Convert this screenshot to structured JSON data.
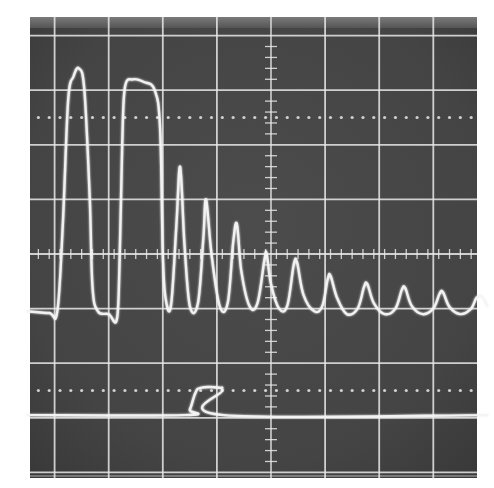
{
  "chart_data": {
    "type": "line",
    "title": "",
    "subtitle": "",
    "xlabel": "",
    "ylabel": "",
    "grid": true,
    "legend": "none",
    "graticule": {
      "x_divisions": 8.5,
      "y_divisions": 8,
      "xlim": [
        -4.5,
        4.0
      ],
      "ylim": [
        -4.0,
        4.0
      ],
      "center_axis_minor_ticks_per_division": 5,
      "dotted_reference_lines_y": [
        2.5,
        -2.5
      ]
    },
    "colors": {
      "screen": "#4a4a4a",
      "screen_dark": "#3a3a3a",
      "grid": "#e8e8e8",
      "trace": "#f4f4f4",
      "paper": "#ffffff"
    },
    "series": [
      {
        "name": "upper-trace",
        "description": "Baseline near -1.05 div with two broad pulses at the left followed by a decaying train of sharp peaks.",
        "baseline": -1.05,
        "points": [
          [
            -4.5,
            -1.05
          ],
          [
            -4.1,
            -1.08
          ],
          [
            -3.95,
            -1.05
          ],
          [
            -3.85,
            0.5
          ],
          [
            -3.75,
            2.8
          ],
          [
            -3.65,
            3.25
          ],
          [
            -3.55,
            3.4
          ],
          [
            -3.45,
            3.0
          ],
          [
            -3.35,
            1.0
          ],
          [
            -3.3,
            -0.6
          ],
          [
            -3.2,
            -1.05
          ],
          [
            -3.0,
            -1.1
          ],
          [
            -2.85,
            -1.2
          ],
          [
            -2.8,
            -0.2
          ],
          [
            -2.75,
            2.0
          ],
          [
            -2.7,
            3.05
          ],
          [
            -2.55,
            3.2
          ],
          [
            -2.35,
            3.15
          ],
          [
            -2.15,
            3.0
          ],
          [
            -2.05,
            2.3
          ],
          [
            -2.0,
            0.0
          ],
          [
            -1.95,
            -0.8
          ],
          [
            -1.85,
            -0.95
          ],
          [
            -1.75,
            0.5
          ],
          [
            -1.68,
            1.6
          ],
          [
            -1.6,
            0.2
          ],
          [
            -1.5,
            -0.95
          ],
          [
            -1.35,
            -0.9
          ],
          [
            -1.25,
            0.3
          ],
          [
            -1.2,
            1.0
          ],
          [
            -1.1,
            0.0
          ],
          [
            -0.95,
            -0.95
          ],
          [
            -0.8,
            -0.9
          ],
          [
            -0.7,
            0.2
          ],
          [
            -0.63,
            0.55
          ],
          [
            -0.55,
            -0.3
          ],
          [
            -0.4,
            -0.95
          ],
          [
            -0.25,
            -0.9
          ],
          [
            -0.12,
            -0.1
          ],
          [
            -0.08,
            0.0
          ],
          [
            0.0,
            -0.55
          ],
          [
            0.15,
            -1.0
          ],
          [
            0.3,
            -0.95
          ],
          [
            0.42,
            -0.2
          ],
          [
            0.48,
            -0.15
          ],
          [
            0.6,
            -0.75
          ],
          [
            0.8,
            -1.05
          ],
          [
            0.95,
            -0.95
          ],
          [
            1.05,
            -0.45
          ],
          [
            1.1,
            -0.4
          ],
          [
            1.22,
            -0.8
          ],
          [
            1.4,
            -1.1
          ],
          [
            1.6,
            -1.0
          ],
          [
            1.72,
            -0.6
          ],
          [
            1.78,
            -0.55
          ],
          [
            1.9,
            -0.9
          ],
          [
            2.1,
            -1.1
          ],
          [
            2.3,
            -1.0
          ],
          [
            2.42,
            -0.65
          ],
          [
            2.48,
            -0.62
          ],
          [
            2.6,
            -0.95
          ],
          [
            2.8,
            -1.1
          ],
          [
            3.0,
            -1.0
          ],
          [
            3.12,
            -0.72
          ],
          [
            3.18,
            -0.7
          ],
          [
            3.3,
            -0.97
          ],
          [
            3.5,
            -1.1
          ],
          [
            3.7,
            -1.0
          ],
          [
            3.8,
            -0.8
          ],
          [
            3.9,
            -0.78
          ],
          [
            4.0,
            -0.95
          ]
        ]
      },
      {
        "name": "lower-trace",
        "description": "Flat baseline near -2.95 div with a single rectangular gate pulse rising to about -2.45 div.",
        "baseline": -2.95,
        "points": [
          [
            -4.5,
            -2.95
          ],
          [
            -1.6,
            -2.95
          ],
          [
            -1.5,
            -2.85
          ],
          [
            -1.4,
            -2.55
          ],
          [
            -1.3,
            -2.45
          ],
          [
            -0.95,
            -2.45
          ],
          [
            -0.9,
            -2.5
          ],
          [
            -0.88,
            -2.95
          ],
          [
            4.0,
            -2.95
          ]
        ]
      }
    ]
  }
}
